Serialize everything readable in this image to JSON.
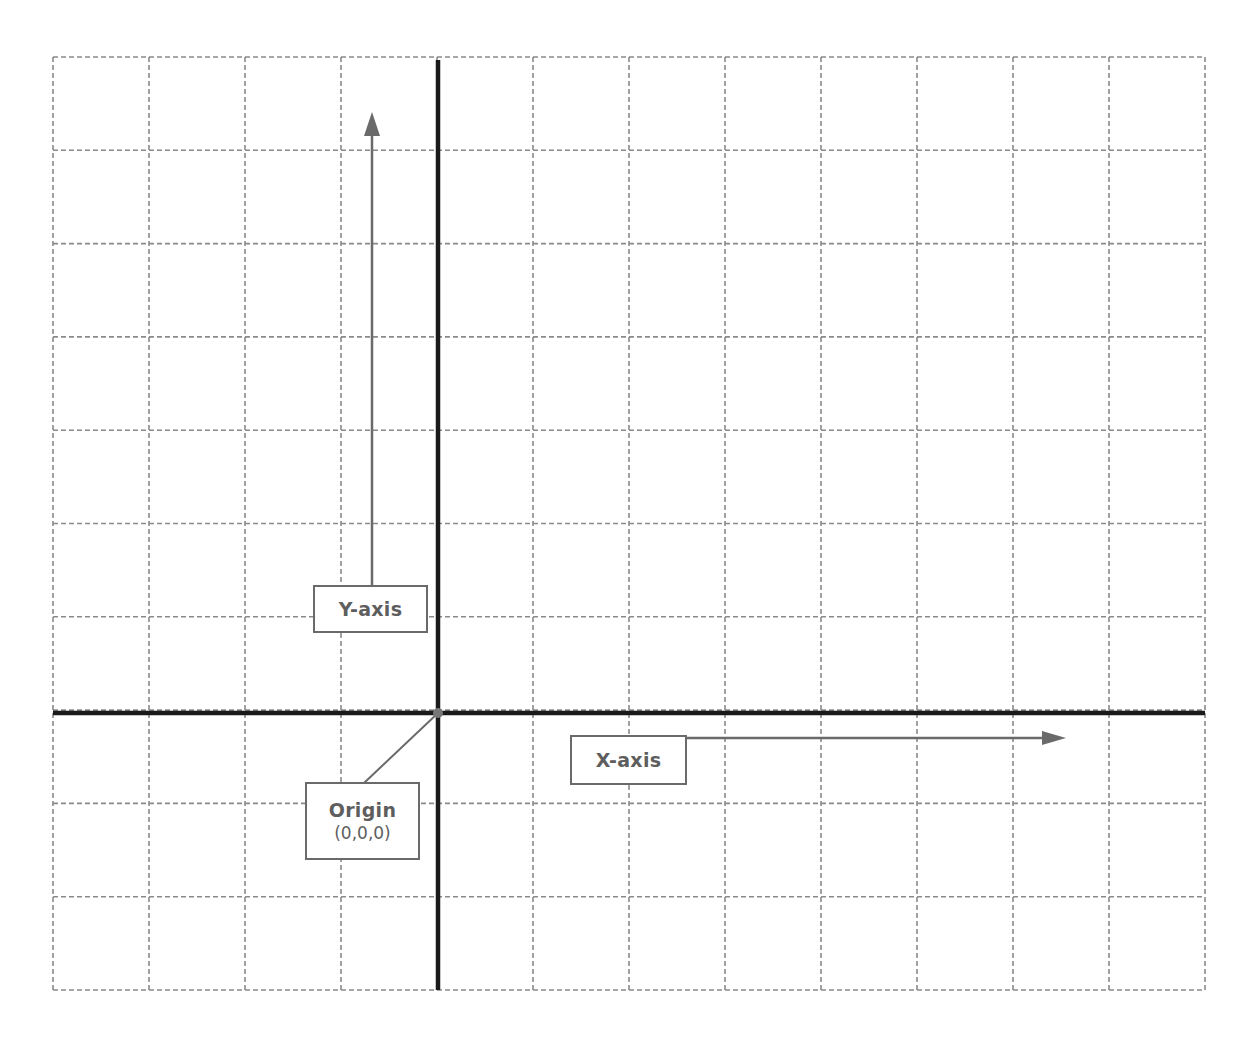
{
  "diagram": {
    "type": "coordinate-grid",
    "grid": {
      "columns": 12,
      "rows": 10,
      "left": 53,
      "right": 1205,
      "top": 57,
      "bottom": 990,
      "line_color": "#8a8a8a",
      "line_style": "dashed"
    },
    "axes": {
      "color": "#1a1a1a",
      "vertical_x": 438,
      "horizontal_y": 713
    },
    "labels": {
      "y_axis": {
        "text": "Y-axis"
      },
      "x_axis": {
        "text": "X-axis"
      },
      "origin": {
        "text": "Origin",
        "coords": "(0,0,0)"
      }
    },
    "arrows": {
      "color": "#6a6a6a",
      "y_arrow": {
        "x": 372,
        "from_y": 586,
        "to_y": 112
      },
      "x_arrow": {
        "y": 738,
        "from_x": 686,
        "to_x": 1066
      }
    },
    "origin_point": {
      "x": 438,
      "y": 713,
      "color": "#777777"
    }
  }
}
